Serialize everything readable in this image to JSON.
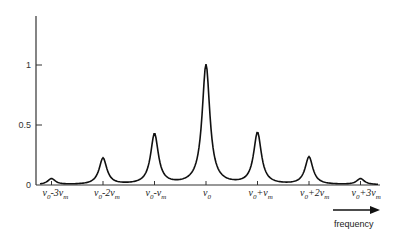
{
  "chart_data": {
    "type": "line",
    "title": "",
    "xlabel": "frequency",
    "ylabel": "",
    "ylim": [
      0,
      1.2
    ],
    "yticks": [
      0,
      0.5,
      1
    ],
    "ytick_labels": [
      "0",
      "0.5",
      "1"
    ],
    "grid": false,
    "legend": null,
    "categories": [
      "ν0-3νm",
      "ν0-2νm",
      "ν0-νm",
      "ν0",
      "ν0+νm",
      "ν0+2νm",
      "ν0+3νm"
    ],
    "x": [
      -3,
      -2,
      -1,
      0,
      1,
      2,
      3
    ],
    "series": [
      {
        "name": "spectrum",
        "values": [
          0.05,
          0.22,
          0.42,
          1.0,
          0.43,
          0.23,
          0.05
        ]
      }
    ],
    "xtick_labels": [
      {
        "main": "ν",
        "sub0": "0",
        "op": "-3",
        "nu": "ν",
        "sub1": "m"
      },
      {
        "main": "ν",
        "sub0": "0",
        "op": "-2",
        "nu": "ν",
        "sub1": "m"
      },
      {
        "main": "ν",
        "sub0": "0",
        "op": "-",
        "nu": "ν",
        "sub1": "m"
      },
      {
        "main": "ν",
        "sub0": "0",
        "op": "",
        "nu": "",
        "sub1": ""
      },
      {
        "main": "ν",
        "sub0": "0",
        "op": "+",
        "nu": "ν",
        "sub1": "m"
      },
      {
        "main": "ν",
        "sub0": "0",
        "op": "+2",
        "nu": "ν",
        "sub1": "m"
      },
      {
        "main": "ν",
        "sub0": "0",
        "op": "+3",
        "nu": "ν",
        "sub1": "m"
      }
    ],
    "annotations": [
      "frequency →"
    ]
  }
}
